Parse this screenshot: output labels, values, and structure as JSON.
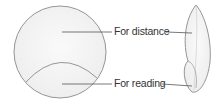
{
  "diagram": {
    "views": [
      "front-view",
      "side-view"
    ],
    "labels": {
      "distance": "For distance",
      "reading": "For reading"
    },
    "colors": {
      "outline": "#8a8a8a",
      "fill": "#f2f2f2",
      "leader": "#555555",
      "text": "#333333"
    }
  }
}
